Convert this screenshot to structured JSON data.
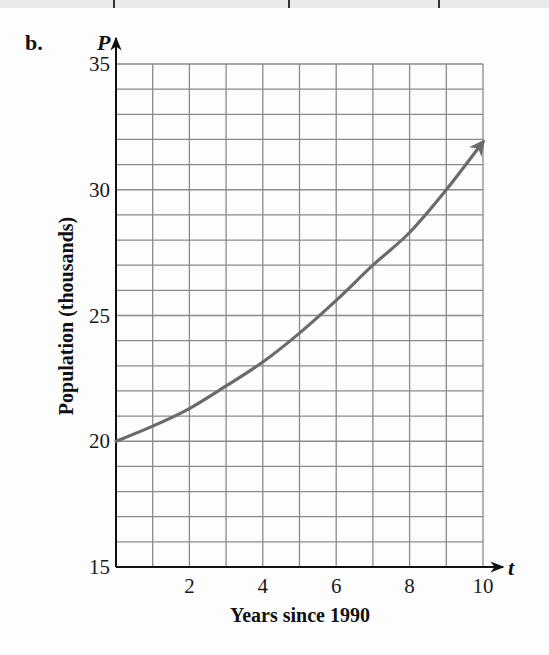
{
  "part_label": "b.",
  "top_strip": {
    "divider_x": [
      113,
      288,
      438
    ]
  },
  "colors": {
    "curve": "#6b6b6b",
    "grid": "#8a8a8a",
    "axis": "#111111"
  },
  "chart_data": {
    "type": "line",
    "title": "",
    "xlabel": "Years since 1990",
    "ylabel": "Population (thousands)",
    "x_axis_variable": "t",
    "y_axis_variable": "P",
    "xlim": [
      0,
      10
    ],
    "ylim": [
      15,
      35
    ],
    "x_ticks": [
      2,
      4,
      6,
      8,
      10
    ],
    "y_ticks": [
      15,
      20,
      25,
      30,
      35
    ],
    "grid": true,
    "grid_x_step": 1,
    "grid_y_step": 1,
    "legend": null,
    "series": [
      {
        "name": "P(t)",
        "arrow_at_end": true,
        "x": [
          0,
          1,
          2,
          3,
          4,
          5,
          6,
          7,
          8,
          9,
          10
        ],
        "values": [
          20.0,
          20.6,
          21.3,
          22.2,
          23.15,
          24.3,
          25.6,
          27.0,
          28.3,
          30.0,
          31.9
        ]
      }
    ]
  }
}
